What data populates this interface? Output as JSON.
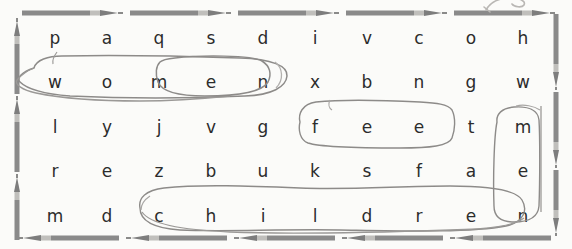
{
  "worksheet": {
    "title": "word-search-puzzle",
    "background_color": "#fbfbf9",
    "letter_color": "#2c2c2c",
    "border_color": "#7d7d7d",
    "mark_color": "#8a8a8a",
    "rows": 5,
    "columns": 10,
    "grid": [
      [
        "p",
        "a",
        "q",
        "s",
        "d",
        "i",
        "v",
        "c",
        "o",
        "h"
      ],
      [
        "w",
        "o",
        "m",
        "e",
        "n",
        "x",
        "b",
        "n",
        "g",
        "w"
      ],
      [
        "l",
        "y",
        "j",
        "v",
        "g",
        "f",
        "e",
        "e",
        "t",
        "m"
      ],
      [
        "r",
        "e",
        "z",
        "b",
        "u",
        "k",
        "s",
        "f",
        "a",
        "e"
      ],
      [
        "m",
        "d",
        "c",
        "h",
        "i",
        "l",
        "d",
        "r",
        "e",
        "n"
      ]
    ],
    "found_words": [
      {
        "word": "women",
        "orientation": "horizontal",
        "row": 1,
        "col_start": 0,
        "col_end": 4
      },
      {
        "word": "feet",
        "orientation": "horizontal",
        "row": 2,
        "col_start": 5,
        "col_end": 8
      },
      {
        "word": "men",
        "orientation": "vertical",
        "col": 9,
        "row_start": 2,
        "row_end": 4
      },
      {
        "word": "children",
        "orientation": "horizontal",
        "row": 4,
        "col_start": 2,
        "col_end": 9
      }
    ],
    "border": {
      "top_icon": "pencil-right-icon",
      "bottom_icon": "pencil-left-icon",
      "left_icon": "pencil-up-icon",
      "right_icon": "pencil-down-icon",
      "top_count": 5,
      "bottom_count": 5,
      "left_count": 3,
      "right_count": 3
    },
    "doodle": "pen-stroke-doodle"
  }
}
